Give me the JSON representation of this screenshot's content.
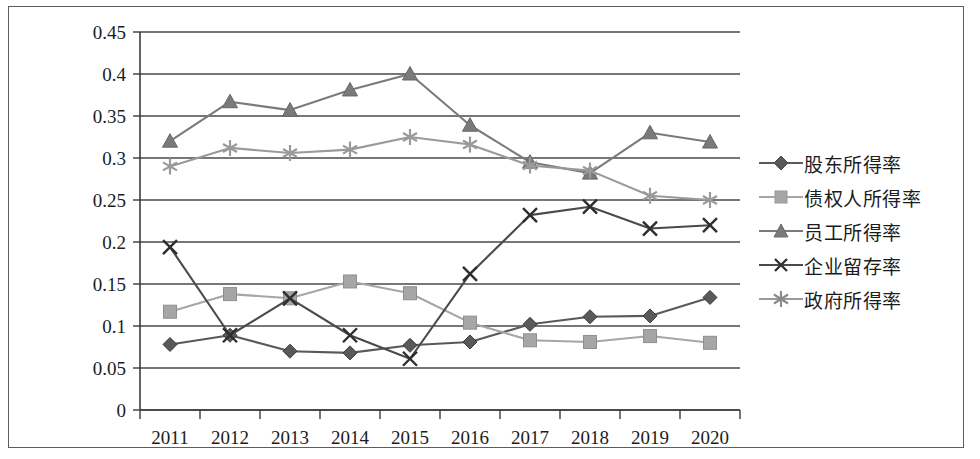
{
  "chart_data": {
    "type": "line",
    "title": "",
    "xlabel": "",
    "ylabel": "",
    "categories": [
      "2011",
      "2012",
      "2013",
      "2014",
      "2015",
      "2016",
      "2017",
      "2018",
      "2019",
      "2020"
    ],
    "ylim": [
      0,
      0.45
    ],
    "ytick_labels": [
      "0",
      "0.05",
      "0.1",
      "0.15",
      "0.2",
      "0.25",
      "0.3",
      "0.35",
      "0.4",
      "0.45"
    ],
    "ytick_values": [
      0,
      0.05,
      0.1,
      0.15,
      0.2,
      0.25,
      0.3,
      0.35,
      0.4,
      0.45
    ],
    "grid": true,
    "legend_position": "right",
    "series": [
      {
        "name": "股东所得率",
        "marker": "diamond",
        "color": "#595959",
        "values": [
          0.078,
          0.089,
          0.07,
          0.068,
          0.077,
          0.081,
          0.102,
          0.111,
          0.112,
          0.134
        ]
      },
      {
        "name": "债权人所得率",
        "marker": "square",
        "color": "#a6a6a6",
        "values": [
          0.117,
          0.138,
          0.133,
          0.153,
          0.139,
          0.104,
          0.083,
          0.081,
          0.088,
          0.08
        ]
      },
      {
        "name": "员工所得率",
        "marker": "triangle",
        "color": "#7a7a7a",
        "values": [
          0.32,
          0.367,
          0.357,
          0.381,
          0.4,
          0.339,
          0.295,
          0.282,
          0.33,
          0.319
        ]
      },
      {
        "name": "企业留存率",
        "marker": "cross",
        "color": "#4a4a4a",
        "values": [
          0.194,
          0.089,
          0.133,
          0.089,
          0.061,
          0.162,
          0.232,
          0.242,
          0.216,
          0.22
        ]
      },
      {
        "name": "政府所得率",
        "marker": "asterisk",
        "color": "#9a9a9a",
        "values": [
          0.29,
          0.312,
          0.306,
          0.31,
          0.325,
          0.316,
          0.291,
          0.285,
          0.255,
          0.25
        ]
      }
    ]
  },
  "legend": {
    "items": [
      {
        "label": "股东所得率"
      },
      {
        "label": "债权人所得率"
      },
      {
        "label": "员工所得率"
      },
      {
        "label": "企业留存率"
      },
      {
        "label": "政府所得率"
      }
    ]
  }
}
